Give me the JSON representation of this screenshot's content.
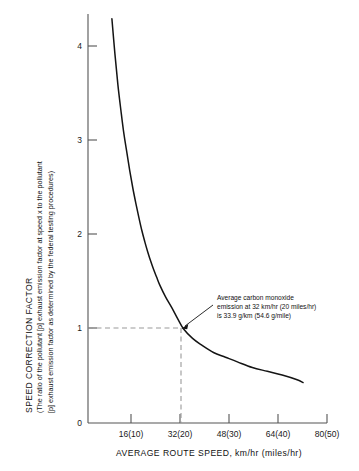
{
  "chart_data": {
    "type": "line",
    "title": "",
    "xlabel": "AVERAGE ROUTE SPEED, km/hr (miles/hr)",
    "ylabel_main": "SPEED CORRECTION FACTOR",
    "ylabel_sub_line1": "(The ratio of the pollutant [p] exhaust emission factor at speed x to the pollutant",
    "ylabel_sub_line2": "[p] exhaust emission factor as determined by the federal testing procedures)",
    "x_tick_labels": [
      "0",
      "16(10)",
      "32(20)",
      "48(30)",
      "64(40)",
      "80(50)"
    ],
    "x_tick_values": [
      0,
      16,
      32,
      48,
      64,
      80
    ],
    "y_tick_labels": [
      "1",
      "2",
      "3",
      "4"
    ],
    "y_tick_values": [
      1,
      2,
      3,
      4
    ],
    "xlim": [
      0,
      80
    ],
    "ylim": [
      0,
      4.55
    ],
    "grid": false,
    "legend": "none",
    "series": [
      {
        "name": "Speed correction factor",
        "x": [
          8.0,
          9.0,
          10.0,
          11.0,
          12.0,
          13.0,
          14.0,
          15.0,
          16.0,
          17.0,
          18.0,
          19.0,
          20.0,
          21.0,
          22.0,
          23.0,
          24.0,
          26.0,
          28.0,
          30.0,
          32.0,
          35.0,
          38.0,
          42.0,
          46.0,
          50.0,
          55.0,
          60.0,
          65.0,
          70.0,
          72.0
        ],
        "y": [
          4.3,
          3.93,
          3.6,
          3.33,
          3.08,
          2.88,
          2.68,
          2.5,
          2.34,
          2.19,
          2.05,
          1.93,
          1.82,
          1.72,
          1.63,
          1.55,
          1.47,
          1.34,
          1.23,
          1.11,
          1.0,
          0.9,
          0.83,
          0.75,
          0.7,
          0.65,
          0.59,
          0.55,
          0.51,
          0.46,
          0.43
        ]
      }
    ],
    "annotation": {
      "line1": "Average carbon monoxide",
      "line2": "emission at 32 km/hr (20 miles/hr)",
      "line3": "is 33.9 g/km (54.6 g/mile)",
      "marker_x": 32,
      "marker_y": 1.0,
      "guide_style": "dashed"
    },
    "colors": {
      "curve": "#141414",
      "axis": "#555555",
      "guide": "#9a9a9a",
      "text": "#111111",
      "background": "#ffffff"
    }
  }
}
